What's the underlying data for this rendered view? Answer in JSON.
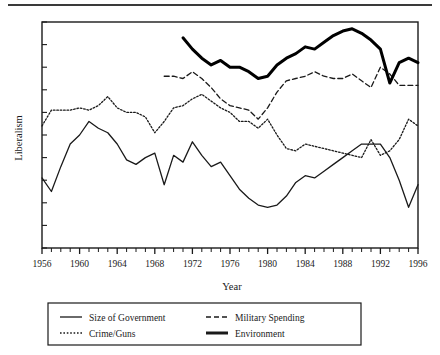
{
  "figure": {
    "background_color": "#ffffff",
    "ink_color": "#1a1a1a",
    "has_top_rule": true
  },
  "chart_data": {
    "type": "line",
    "title": "",
    "xlabel": "Year",
    "ylabel": "Liberalism",
    "xlim": [
      1956,
      1996
    ],
    "ylim": [
      0,
      100
    ],
    "grid": false,
    "y_tick_labels": [],
    "y_ticks_unlabeled_count": 10,
    "x_tick_labels": [
      "1956",
      "1960",
      "1964",
      "1968",
      "1972",
      "1976",
      "1980",
      "1984",
      "1988",
      "1992",
      "1996"
    ],
    "x_minor_tick_interval": 1,
    "legend_position": "below-plot",
    "legend_entries": [
      {
        "label": "Size of Government",
        "style": "solid-thin"
      },
      {
        "label": "Military Spending",
        "style": "dashed"
      },
      {
        "label": "Crime/Guns",
        "style": "dotted"
      },
      {
        "label": "Environment",
        "style": "solid-thick"
      }
    ],
    "series": [
      {
        "name": "Size of Government",
        "style": "solid-thin",
        "color": "#1a1a1a",
        "x": [
          1956,
          1957,
          1958,
          1959,
          1960,
          1961,
          1962,
          1963,
          1964,
          1965,
          1966,
          1967,
          1968,
          1969,
          1970,
          1971,
          1972,
          1973,
          1974,
          1975,
          1976,
          1977,
          1978,
          1979,
          1980,
          1981,
          1982,
          1983,
          1984,
          1985,
          1986,
          1987,
          1988,
          1989,
          1990,
          1991,
          1992,
          1993,
          1994,
          1995,
          1996
        ],
        "values": [
          31,
          25,
          36,
          46,
          50,
          56,
          53,
          51,
          46,
          39,
          37,
          40,
          42,
          28,
          41,
          38,
          47,
          41,
          36,
          38,
          32,
          26,
          22,
          19,
          18,
          19,
          23,
          29,
          32,
          31,
          34,
          37,
          40,
          43,
          46,
          46,
          46,
          40,
          30,
          18,
          28
        ]
      },
      {
        "name": "Crime/Guns",
        "style": "dotted",
        "color": "#1a1a1a",
        "x": [
          1956,
          1957,
          1958,
          1959,
          1960,
          1961,
          1962,
          1963,
          1964,
          1965,
          1966,
          1967,
          1968,
          1969,
          1970,
          1971,
          1972,
          1973,
          1974,
          1975,
          1976,
          1977,
          1978,
          1979,
          1980,
          1981,
          1982,
          1983,
          1984,
          1985,
          1986,
          1987,
          1988,
          1989,
          1990,
          1991,
          1992,
          1993,
          1994,
          1995,
          1996
        ],
        "values": [
          54,
          61,
          61,
          61,
          62,
          61,
          63,
          67,
          62,
          60,
          60,
          58,
          51,
          56,
          62,
          63,
          66,
          68,
          65,
          62,
          60,
          56,
          56,
          53,
          57,
          50,
          44,
          43,
          46,
          45,
          44,
          43,
          42,
          41,
          40,
          48,
          41,
          43,
          48,
          57,
          54
        ]
      },
      {
        "name": "Military Spending",
        "style": "dashed",
        "color": "#1a1a1a",
        "x": [
          1969,
          1970,
          1971,
          1972,
          1973,
          1974,
          1975,
          1976,
          1977,
          1978,
          1979,
          1980,
          1981,
          1982,
          1983,
          1984,
          1985,
          1986,
          1987,
          1988,
          1989,
          1990,
          1991,
          1992,
          1993,
          1994,
          1995,
          1996
        ],
        "values": [
          76,
          76,
          75,
          78,
          75,
          71,
          66,
          63,
          62,
          61,
          57,
          62,
          69,
          74,
          75,
          76,
          78,
          76,
          75,
          75,
          77,
          74,
          71,
          80,
          77,
          72,
          72,
          72
        ]
      },
      {
        "name": "Environment",
        "style": "solid-thick",
        "color": "#000000",
        "x": [
          1971,
          1972,
          1973,
          1974,
          1975,
          1976,
          1977,
          1978,
          1979,
          1980,
          1981,
          1982,
          1983,
          1984,
          1985,
          1986,
          1987,
          1988,
          1989,
          1990,
          1991,
          1992,
          1993,
          1994,
          1995,
          1996
        ],
        "values": [
          93,
          88,
          84,
          81,
          83,
          80,
          80,
          78,
          75,
          76,
          81,
          84,
          86,
          89,
          88,
          91,
          94,
          96,
          97,
          95,
          92,
          88,
          73,
          82,
          84,
          82
        ]
      }
    ]
  }
}
